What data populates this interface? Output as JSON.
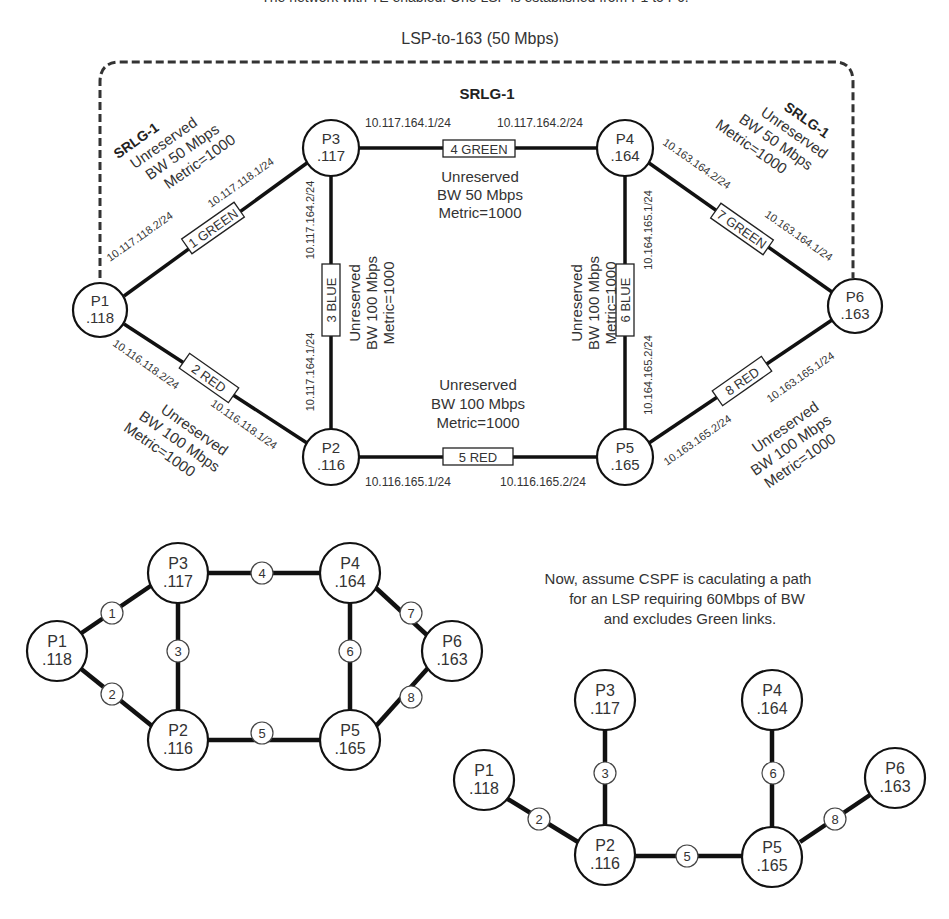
{
  "header": {
    "caption": "The network with TE enabled. One LSP is established from P1 to P6.",
    "lsp_label": "LSP-to-163 (50 Mbps)",
    "srlg_top": "SRLG-1"
  },
  "nodes": {
    "p1": {
      "name": "P1",
      "addr": ".118"
    },
    "p2": {
      "name": "P2",
      "addr": ".116"
    },
    "p3": {
      "name": "P3",
      "addr": ".117"
    },
    "p4": {
      "name": "P4",
      "addr": ".164"
    },
    "p5": {
      "name": "P5",
      "addr": ".165"
    },
    "p6": {
      "name": "P6",
      "addr": ".163"
    }
  },
  "links": {
    "l1": {
      "label": "1 GREEN",
      "ip_a": "10.117.118.2/24",
      "ip_b": "10.117.118.1/24",
      "srlg": "SRLG-1",
      "unres": "Unreserved",
      "bw": "BW 50 Mbps",
      "metric": "Metric=1000"
    },
    "l2": {
      "label": "2 RED",
      "ip_a": "10.116.118.2/24",
      "ip_b": "10.116.118.1/24",
      "unres": "Unreserved",
      "bw": "BW 100 Mbps",
      "metric": "Metric=1000"
    },
    "l3": {
      "label": "3 BLUE",
      "ip_a": "10.117.164.2/24",
      "ip_b": "10.117.164.1/24",
      "unres": "Unreserved",
      "bw": "BW 100 Mbps",
      "metric": "Metric=1000"
    },
    "l4": {
      "label": "4 GREEN",
      "ip_a": "10.117.164.1/24",
      "ip_b": "10.117.164.2/24",
      "unres": "Unreserved",
      "bw": "BW 50 Mbps",
      "metric": "Metric=1000"
    },
    "l5": {
      "label": "5 RED",
      "ip_a": "10.116.165.1/24",
      "ip_b": "10.116.165.2/24",
      "unres": "Unreserved",
      "bw": "BW 100 Mbps",
      "metric": "Metric=1000"
    },
    "l6": {
      "label": "6 BLUE",
      "ip_a": "10.164.165.1/24",
      "ip_b": "10.164.165.2/24",
      "unres": "Unreserved",
      "bw": "BW 100 Mbps",
      "metric": "Metric=1000"
    },
    "l7": {
      "label": "7 GREEN",
      "ip_a": "10.163.164.2/24",
      "ip_b": "10.163.164.1/24",
      "srlg": "SRLG-1",
      "unres": "Unreserved",
      "bw": "BW 50 Mbps",
      "metric": "Metric=1000"
    },
    "l8": {
      "label": "8 RED",
      "ip_a": "10.163.165.2/24",
      "ip_b": "10.163.165.1/24",
      "unres": "Unreserved",
      "bw": "BW 100 Mbps",
      "metric": "Metric=1000"
    }
  },
  "simple_topology": {
    "link_numbers": [
      "1",
      "2",
      "3",
      "4",
      "5",
      "6",
      "7",
      "8"
    ]
  },
  "cspf": {
    "note_line1": "Now, assume CSPF is caculating a path",
    "note_line2": "for an LSP requiring 60Mbps of BW",
    "note_line3": "and excludes Green links.",
    "link_numbers": [
      "2",
      "3",
      "5",
      "6",
      "8"
    ]
  }
}
